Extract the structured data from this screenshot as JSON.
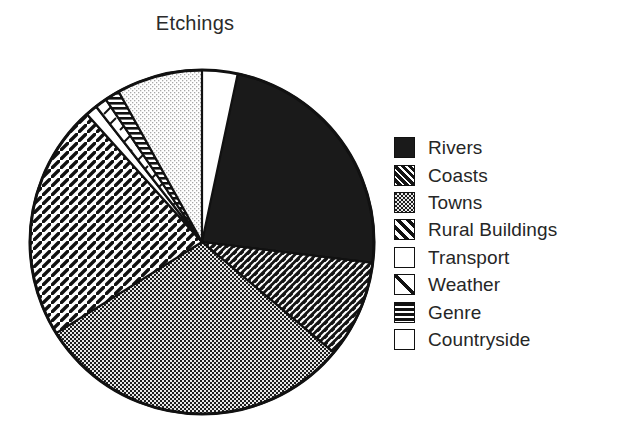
{
  "chart_data": {
    "type": "pie",
    "title": "Etchings",
    "xlabel": "",
    "ylabel": "",
    "legend_position": "right",
    "grid": false,
    "start_angle_deg": 12,
    "direction": "clockwise",
    "categories": [
      "Rivers",
      "Coasts",
      "Towns",
      "Rural Buildings",
      "Transport",
      "Weather",
      "Genre",
      "Countryside"
    ],
    "values": [
      23.6,
      9.2,
      30.0,
      22.2,
      1.1,
      1.1,
      1.4,
      8.0
    ],
    "slices": [
      {
        "label": "Rivers",
        "value": 23.6,
        "angle_deg": 85,
        "pattern": "solid-black",
        "fill_hex": "#1a1a1a"
      },
      {
        "label": "Coasts",
        "value": 9.2,
        "angle_deg": 33,
        "pattern": "dense-diagonal-dash",
        "fill_hex": "#1a1a1a"
      },
      {
        "label": "Towns",
        "value": 30.0,
        "angle_deg": 108,
        "pattern": "stipple-checker",
        "fill_hex": "#3a3a3a"
      },
      {
        "label": "Rural Buildings",
        "value": 22.2,
        "angle_deg": 80,
        "pattern": "wide-diagonal-hatch",
        "fill_hex": "#ffffff"
      },
      {
        "label": "Transport",
        "value": 1.1,
        "angle_deg": 4,
        "pattern": "empty-white",
        "fill_hex": "#ffffff"
      },
      {
        "label": "Weather",
        "value": 1.1,
        "angle_deg": 4,
        "pattern": "single-diagonal-line",
        "fill_hex": "#ffffff"
      },
      {
        "label": "Genre",
        "value": 1.4,
        "angle_deg": 5,
        "pattern": "horizontal-stripes",
        "fill_hex": "#ffffff"
      },
      {
        "label": "Countryside",
        "value": 8.0,
        "angle_deg": 29,
        "pattern": "light-stipple",
        "fill_hex": "#f0f0f0"
      }
    ]
  },
  "title": {
    "text": "Etchings"
  },
  "legend": {
    "items": [
      {
        "label": "Rivers",
        "swatch": "swatch-solid-black"
      },
      {
        "label": "Coasts",
        "swatch": "swatch-dark-diagonal-dash"
      },
      {
        "label": "Towns",
        "swatch": "swatch-dark-stipple"
      },
      {
        "label": "Rural Buildings",
        "swatch": "swatch-wide-diagonal-hatch"
      },
      {
        "label": "Transport",
        "swatch": "swatch-empty"
      },
      {
        "label": "Weather",
        "swatch": "swatch-single-diagonal-line"
      },
      {
        "label": "Genre",
        "swatch": "swatch-horizontal-stripes"
      },
      {
        "label": "Countryside",
        "swatch": "swatch-empty"
      }
    ]
  },
  "colors": {
    "ink": "#1a1a1a",
    "background": "#ffffff",
    "stipple_dark": "#3a3a3a",
    "stipple_light": "#f0f0f0"
  }
}
